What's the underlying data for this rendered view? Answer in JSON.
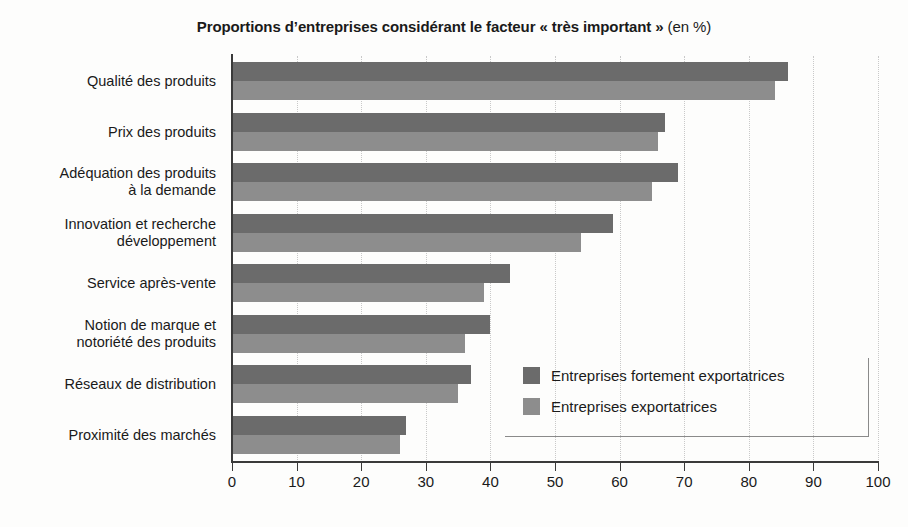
{
  "chart_data": {
    "type": "bar",
    "orientation": "horizontal",
    "title": "Proportions d’entreprises considérant le facteur « très important » (en %)",
    "title_bold_part": "Proportions d’entreprises considérant le facteur « très important »",
    "title_normal_part": " (en %)",
    "xlabel": "",
    "ylabel": "",
    "xlim": [
      0,
      100
    ],
    "xticks": [
      0,
      10,
      20,
      30,
      40,
      50,
      60,
      70,
      80,
      90,
      100
    ],
    "xtick_labels": [
      "0",
      "10",
      "20",
      "30",
      "40",
      "50",
      "60",
      "70",
      "80",
      "90",
      "100"
    ],
    "grid": "vertical-dotted",
    "legend_position": "inside-bottom-right",
    "categories": [
      "Qualité des produits",
      "Prix des produits",
      "Adéquation des produits à la demande",
      "Innovation et recherche développement",
      "Service après-vente",
      "Notion de marque et notoriété des produits",
      "Réseaux de distribution",
      "Proximité des marchés"
    ],
    "category_label_lines": [
      [
        "Qualité des produits"
      ],
      [
        "Prix des produits"
      ],
      [
        "Adéquation des produits",
        "à la demande"
      ],
      [
        "Innovation et recherche",
        "développement"
      ],
      [
        "Service après-vente"
      ],
      [
        "Notion de marque et",
        "notoriété des produits"
      ],
      [
        "Réseaux de distribution"
      ],
      [
        "Proximité des marchés"
      ]
    ],
    "series": [
      {
        "name": "Entreprises fortement exportatrices",
        "color": "#6b6b6b",
        "values": [
          86,
          67,
          69,
          59,
          43,
          40,
          37,
          27
        ]
      },
      {
        "name": "Entreprises exportatrices",
        "color": "#8d8d8d",
        "values": [
          84,
          66,
          65,
          54,
          39,
          36,
          35,
          26
        ]
      }
    ]
  },
  "legend": {
    "entries": [
      {
        "label": "Entreprises fortement exportatrices"
      },
      {
        "label": "Entreprises exportatrices"
      }
    ]
  },
  "colors": {
    "series_dark": "#6b6b6b",
    "series_light": "#8d8d8d",
    "axis": "#3a3a3a",
    "gridline": "#c9c9c9",
    "background": "#fdfdfc",
    "text": "#1a1a1a"
  }
}
